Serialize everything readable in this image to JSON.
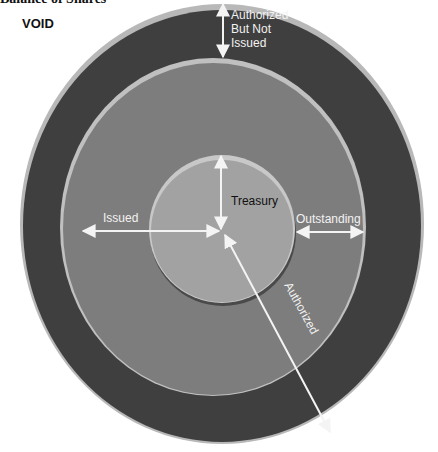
{
  "header": {
    "title": "Balance of Shares",
    "stamp": "VOID"
  },
  "diagram": {
    "type": "nested-circles",
    "colors": {
      "outer_ring": "#3f3f3f",
      "outer_rim": "#b8b8b8",
      "middle_ring": "#7d7d7d",
      "middle_rim": "#c0c0c0",
      "inner_disc": "#a2a2a2",
      "inner_rim": "#c8c8c8",
      "arrow": "#f4f4f4"
    },
    "labels": {
      "authorized_not_issued": [
        "Authorized",
        "But Not",
        "Issued"
      ],
      "treasury": "Treasury",
      "issued": "Issued",
      "outstanding": "Outstanding",
      "authorized": "Authorized"
    }
  }
}
